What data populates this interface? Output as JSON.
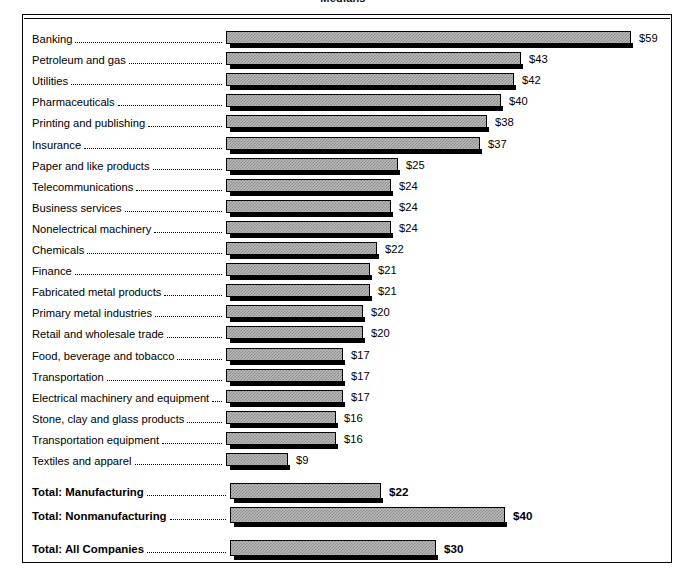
{
  "chart_data": {
    "type": "bar",
    "orientation": "horizontal",
    "title": "Medians",
    "xlabel": "",
    "ylabel": "",
    "value_prefix": "$",
    "xlim": [
      0,
      59
    ],
    "grid": false,
    "legend": null,
    "categories": [
      "Banking",
      "Petroleum and gas",
      "Utilities",
      "Pharmaceuticals",
      "Printing and publishing",
      "Insurance",
      "Paper and like products",
      "Telecommunications",
      "Business services",
      "Nonelectrical machinery",
      "Chemicals",
      "Finance",
      "Fabricated metal products",
      "Primary metal industries",
      "Retail and wholesale trade",
      "Food, beverage and tobacco",
      "Transportation",
      "Electrical machinery and equipment",
      "Stone, clay and glass products",
      "Transportation equipment",
      "Textiles and apparel"
    ],
    "values": [
      59,
      43,
      42,
      40,
      38,
      37,
      25,
      24,
      24,
      24,
      22,
      21,
      21,
      20,
      20,
      17,
      17,
      17,
      16,
      16,
      9
    ],
    "value_labels": [
      "$59",
      "$43",
      "$42",
      "$40",
      "$38",
      "$37",
      "$25",
      "$24",
      "$24",
      "$24",
      "$22",
      "$21",
      "$21",
      "$20",
      "$20",
      "$17",
      "$17",
      "$17",
      "$16",
      "$16",
      "$9"
    ],
    "totals": {
      "categories": [
        "Total: Manufacturing",
        "Total: Nonmanufacturing",
        "Total: All Companies"
      ],
      "values": [
        22,
        40,
        30
      ],
      "value_labels": [
        "$22",
        "$40",
        "$30"
      ]
    }
  },
  "colors": {
    "bar_fill": "#b9b9b9",
    "bar_hatch": "#8d8d8d",
    "bar_outline": "#000000",
    "bar_shadow": "#000000",
    "frame": "#000000",
    "text": "#000000",
    "background": "#ffffff"
  }
}
